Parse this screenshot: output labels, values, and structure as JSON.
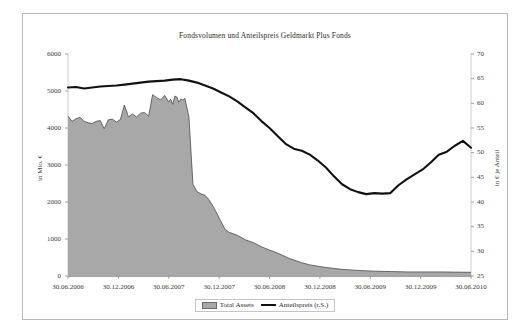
{
  "chart_data": {
    "type": "area",
    "title": "Fondsvolumen und Anteilspreis Geldmarkt Plus Fonds",
    "xlabel": "",
    "ylabel": "in Mio. €",
    "ylabel_right": "in € je Anteil",
    "grid": false,
    "legend_position": "bottom",
    "ylim": [
      0,
      6000
    ],
    "ylim_right": [
      25,
      70
    ],
    "yticks": [
      "0",
      "1000",
      "2000",
      "3000",
      "4000",
      "5000",
      "6000"
    ],
    "yticks_right": [
      "25",
      "30",
      "35",
      "40",
      "45",
      "50",
      "55",
      "60",
      "65",
      "70"
    ],
    "xticks": [
      "30.06.2006",
      "30.12.2006",
      "30.06.2007",
      "30.12.2007",
      "30.06.2008",
      "30.12.2008",
      "30.06.2009",
      "30.12.2009",
      "30.06.2010"
    ],
    "series": [
      {
        "name": "Total Assets",
        "axis": "left",
        "kind": "area",
        "color": "#a8a8a8",
        "edge_color": "#4a4a4a",
        "x": [
          0.0,
          0.01,
          0.02,
          0.03,
          0.04,
          0.05,
          0.06,
          0.07,
          0.08,
          0.09,
          0.1,
          0.11,
          0.12,
          0.13,
          0.14,
          0.15,
          0.16,
          0.17,
          0.18,
          0.19,
          0.2,
          0.21,
          0.22,
          0.23,
          0.24,
          0.25,
          0.255,
          0.26,
          0.265,
          0.27,
          0.275,
          0.28,
          0.285,
          0.29,
          0.3,
          0.31,
          0.32,
          0.33,
          0.34,
          0.35,
          0.36,
          0.37,
          0.38,
          0.39,
          0.4,
          0.42,
          0.44,
          0.46,
          0.48,
          0.5,
          0.52,
          0.55,
          0.58,
          0.6,
          0.64,
          0.68,
          0.72,
          0.76,
          0.8,
          0.84,
          0.88,
          0.92,
          0.96,
          1.0
        ],
        "values": [
          4320,
          4180,
          4250,
          4290,
          4180,
          4140,
          4120,
          4180,
          4200,
          3980,
          4220,
          4240,
          4160,
          4230,
          4620,
          4300,
          4380,
          4300,
          4400,
          4420,
          4320,
          4900,
          4820,
          4760,
          4880,
          4700,
          4780,
          4640,
          4860,
          4840,
          4700,
          4780,
          4760,
          4800,
          4300,
          2480,
          2280,
          2220,
          2180,
          2060,
          1880,
          1680,
          1460,
          1260,
          1180,
          1100,
          980,
          900,
          790,
          700,
          620,
          470,
          360,
          300,
          230,
          180,
          150,
          130,
          120,
          110,
          110,
          110,
          105,
          100
        ]
      },
      {
        "name": "Anteilspreis (r.S.)",
        "axis": "right",
        "kind": "line",
        "color": "#111111",
        "x": [
          0.0,
          0.02,
          0.04,
          0.06,
          0.08,
          0.1,
          0.12,
          0.14,
          0.16,
          0.18,
          0.2,
          0.22,
          0.24,
          0.26,
          0.28,
          0.3,
          0.32,
          0.34,
          0.36,
          0.38,
          0.4,
          0.42,
          0.44,
          0.46,
          0.48,
          0.5,
          0.52,
          0.54,
          0.56,
          0.58,
          0.6,
          0.62,
          0.64,
          0.66,
          0.68,
          0.7,
          0.72,
          0.74,
          0.76,
          0.78,
          0.8,
          0.82,
          0.84,
          0.86,
          0.88,
          0.9,
          0.92,
          0.94,
          0.96,
          0.98,
          1.0
        ],
        "values": [
          63.2,
          63.3,
          63.0,
          63.2,
          63.4,
          63.5,
          63.6,
          63.8,
          64.0,
          64.2,
          64.4,
          64.5,
          64.6,
          64.8,
          64.9,
          64.6,
          64.2,
          63.6,
          63.0,
          62.2,
          61.4,
          60.4,
          59.2,
          58.0,
          56.4,
          55.0,
          53.4,
          51.8,
          50.8,
          50.4,
          49.6,
          48.4,
          47.0,
          45.2,
          43.6,
          42.6,
          42.0,
          41.6,
          41.8,
          41.7,
          41.8,
          43.4,
          44.6,
          45.6,
          46.6,
          48.0,
          49.6,
          50.2,
          51.4,
          52.4,
          51.0
        ]
      }
    ]
  }
}
